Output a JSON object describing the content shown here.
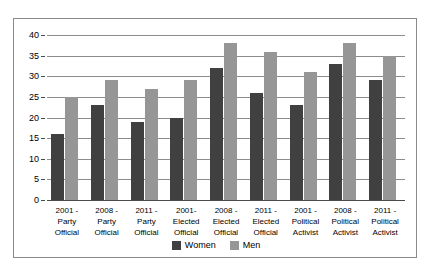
{
  "chart_data": {
    "type": "bar",
    "title": "",
    "xlabel": "",
    "ylabel": "",
    "ylim": [
      0,
      40
    ],
    "yticks": [
      0,
      5,
      10,
      15,
      20,
      25,
      30,
      35,
      40
    ],
    "grid": true,
    "legend_position": "bottom",
    "categories": [
      "2001 - Party Official",
      "2008 - Party Official",
      "2011 - Party Official",
      "2001- Elected Official",
      "2008 - Elected Official",
      "2011 - Elected Official",
      "2001 - Political Activist",
      "2008 - Political Activist",
      "2011 - Political Activist"
    ],
    "category_lines": [
      [
        "2001 -",
        "Party",
        "Official"
      ],
      [
        "2008 -",
        "Party",
        "Official"
      ],
      [
        "2011 -",
        "Party",
        "Official"
      ],
      [
        "2001-",
        "Elected",
        "Official"
      ],
      [
        "2008 -",
        "Elected",
        "Official"
      ],
      [
        "2011 -",
        "Elected",
        "Official"
      ],
      [
        "2001 -",
        "Political",
        "Activist"
      ],
      [
        "2008 -",
        "Political",
        "Activist"
      ],
      [
        "2011 -",
        "Political",
        "Activist"
      ]
    ],
    "series": [
      {
        "name": "Women",
        "color": "#404040",
        "values": [
          16,
          23,
          19,
          20,
          32,
          26,
          23,
          33,
          29
        ]
      },
      {
        "name": "Men",
        "color": "#969696",
        "values": [
          25,
          29,
          27,
          29,
          38,
          36,
          31,
          38,
          35
        ]
      }
    ]
  }
}
